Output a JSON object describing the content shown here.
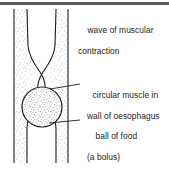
{
  "figure": {
    "background_color": "#ffffff",
    "ink_color": "#1b1b1b",
    "rule_color": "#5a5a5a",
    "stipple_color": "#8d8d8d",
    "width": 169,
    "height": 173
  },
  "labels": {
    "wave": {
      "line1": "wave of muscular",
      "line2": "contraction",
      "has_leader_line": false
    },
    "circular_muscle": {
      "line1": "circular muscle in",
      "line2": "wall of oesophagus",
      "has_leader_line": true
    },
    "bolus": {
      "line1": "ball of food",
      "line2": "(a bolus)",
      "has_leader_line": true
    }
  },
  "diagram": {
    "parts": [
      {
        "name": "oesophagus-tube-left-wall",
        "description": "stippled left wall of oesophagus"
      },
      {
        "name": "oesophagus-tube-right-wall",
        "description": "stippled right wall of oesophagus"
      },
      {
        "name": "constriction",
        "description": "narrowed region where circular muscle contracts"
      },
      {
        "name": "bolus",
        "description": "stippled round ball of food"
      }
    ],
    "leader_lines": [
      {
        "name": "leader-circular-muscle",
        "from_x": 50,
        "from_y": 89,
        "to_x": 80,
        "to_y": 84
      },
      {
        "name": "leader-bolus",
        "from_x": 49,
        "from_y": 123,
        "to_x": 80,
        "to_y": 120
      }
    ]
  }
}
